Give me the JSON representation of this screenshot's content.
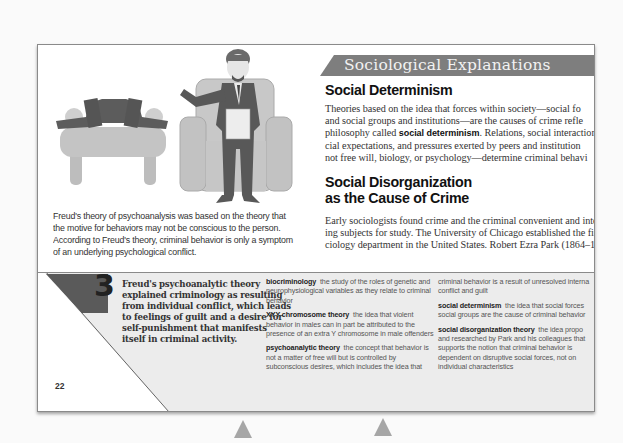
{
  "page": {
    "page_number": "22",
    "illustration": {
      "name": "psychoanalysis-session-illustration",
      "description": "patient lying on couch, therapist seated in armchair holding clipboard"
    },
    "caption": [
      "Freud's theory of psychoanalysis was based on the theory that",
      "the motive for behaviors may not be conscious to the person.",
      "According to Freud's theory, criminal behavior is only a symptom",
      "of an underlying psychological conflict."
    ],
    "section_banner": "Sociological Explanations",
    "sections": [
      {
        "heading": "Social Determinism",
        "lines": [
          "Theories based on the idea that forces within society—social fo",
          "and social groups and institutions—are the causes of crime refle",
          "philosophy called |social determinism|. Relations, social interactions,",
          "cial expectations, and pressures exerted by peers and institution",
          "not free will, biology, or psychology—determine criminal behavi"
        ],
        "bold_term": "social determinism"
      },
      {
        "heading_lines": [
          "Social Disorganization",
          "as the Cause of Crime"
        ],
        "lines": [
          "Early sociologists found crime and the criminal convenient and inte",
          "ing subjects for study. The University of Chicago established the first",
          "ciology department in the United States. Robert Ezra Park (1864–1"
        ]
      }
    ],
    "callout": {
      "step_number": "3",
      "lines": [
        "Freud's psychoanalytic theory",
        "explained criminology as resulting",
        "from individual conflict, which leads",
        "to feelings of guilt and a desire for",
        "self-punishment that manifests",
        "itself in criminal activity."
      ]
    },
    "glossary_col1": [
      {
        "term": "biocriminology",
        "lines": [
          "the study of the roles of genetic and",
          "neurophysiological variables as they relate to criminal",
          "behavior"
        ]
      },
      {
        "term": "XYY chromosome theory",
        "lines": [
          "the idea that violent",
          "behavior in males can in part be attributed to the",
          "presence of an extra Y chromosome in male offenders"
        ]
      },
      {
        "term": "psychoanalytic theory",
        "lines": [
          "the concept that behavior is",
          "not a matter of free will but is controlled by",
          "subconscious desires, which includes the idea that"
        ]
      }
    ],
    "glossary_col2": [
      {
        "term": "",
        "lines": [
          "criminal behavior is a result of unresolved interna",
          "conflict and guilt"
        ]
      },
      {
        "term": "social determinism",
        "lines": [
          "the idea that social forces",
          "social groups are the cause of criminal behavior"
        ]
      },
      {
        "term": "social disorganization theory",
        "lines": [
          "the idea propo",
          "and researched by Park and his colleagues that",
          "supports the notion that criminal behavior is",
          "dependent on disruptive social forces, not on",
          "individual characteristics"
        ]
      }
    ],
    "colors": {
      "banner": "#7e7e7e",
      "bottom_fill": "#ececec",
      "triangle": "#5a5a5a",
      "arrows": "#a6a6a6"
    }
  }
}
